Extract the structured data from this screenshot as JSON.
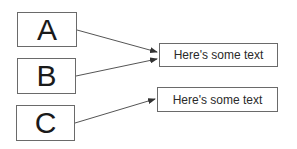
{
  "diagram": {
    "sources": [
      {
        "id": "A",
        "label": "A"
      },
      {
        "id": "B",
        "label": "B"
      },
      {
        "id": "C",
        "label": "C"
      }
    ],
    "targets": [
      {
        "id": "t1",
        "label": "Here's some text"
      },
      {
        "id": "t2",
        "label": "Here's some text"
      }
    ],
    "connections": [
      {
        "from": "A",
        "to": "t1"
      },
      {
        "from": "B",
        "to": "t1"
      },
      {
        "from": "C",
        "to": "t2"
      }
    ],
    "colors": {
      "stroke": "#555555",
      "text": "#1a1a1a"
    }
  }
}
